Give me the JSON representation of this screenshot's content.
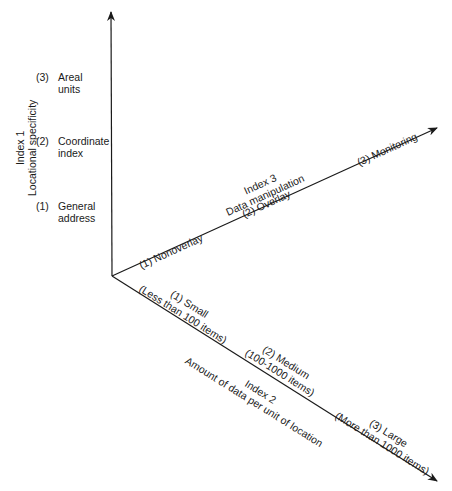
{
  "diagram": {
    "index1": {
      "title": "Index 1",
      "subtitle": "Locational specificity",
      "levels": [
        {
          "num": "(1)",
          "line1": "General",
          "line2": "address"
        },
        {
          "num": "(2)",
          "line1": "Coordinate",
          "line2": "index"
        },
        {
          "num": "(3)",
          "line1": "Areal",
          "line2": "units"
        }
      ]
    },
    "index2": {
      "title": "Index 2",
      "subtitle": "Amount of data per unit of location",
      "levels": [
        {
          "line1": "(1)  Small",
          "line2": "(Less than 100 items)"
        },
        {
          "line1": "(2)  Medium",
          "line2": "(100-1000 items)"
        },
        {
          "line1": "(3)  Large",
          "line2": "(More than 1000 items)"
        }
      ]
    },
    "index3": {
      "title": "Index 3",
      "subtitle": "Data manipulation",
      "levels": [
        {
          "label": "(1)  Nonoverlay"
        },
        {
          "label": "(2)  Overlay"
        },
        {
          "label": "(3)  Monitoring"
        }
      ]
    },
    "colors": {
      "ink": "#1a1a1a",
      "background": "#ffffff"
    }
  }
}
